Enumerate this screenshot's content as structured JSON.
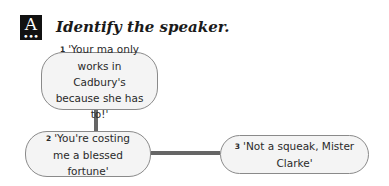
{
  "badge": {
    "letter": "A",
    "dots": "•••"
  },
  "heading": "Identify the speaker.",
  "colors": {
    "badge_bg": "#111111",
    "bubble_fill": "#f4f4f4",
    "bubble_border": "#8a8a8a",
    "connector": "#666666"
  },
  "bubbles": [
    {
      "number": "1",
      "text": "'Your ma only works in Cadbury's because she has to!'"
    },
    {
      "number": "2",
      "text": "'You're costing me a blessed fortune'"
    },
    {
      "number": "3",
      "text": "'Not a squeak, Mister Clarke'"
    }
  ]
}
